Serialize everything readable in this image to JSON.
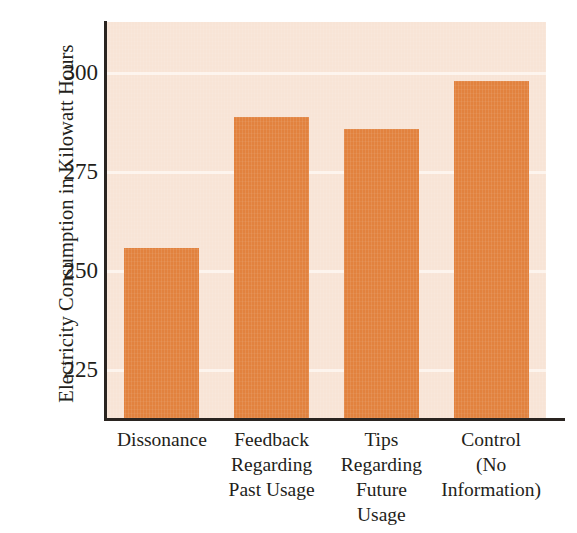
{
  "chart_data": {
    "type": "bar",
    "title": "",
    "xlabel": "",
    "ylabel": "Electricity Consumption in Kilowatt Hours",
    "categories": [
      "Dissonance",
      "Feedback Regarding Past Usage",
      "Tips Regarding Future Usage",
      "Control (No Information)"
    ],
    "category_lines": [
      [
        "Dissonance"
      ],
      [
        "Feedback",
        "Regarding",
        "Past Usage"
      ],
      [
        "Tips",
        "Regarding",
        "Future",
        "Usage"
      ],
      [
        "Control",
        "(No",
        "Information)"
      ]
    ],
    "values": [
      256,
      289,
      286,
      298
    ],
    "ylim": [
      213,
      313
    ],
    "yticks": [
      225,
      250,
      275,
      300
    ],
    "ytick_labels": [
      "225",
      "250",
      "275",
      "300"
    ],
    "grid": true,
    "legend": "none",
    "colors": {
      "bar": "#e2823e",
      "plot_background": "#f8e4d6",
      "gridline": "#fdf4ee",
      "axis": "#2a2420",
      "text": "#231e1a",
      "page_background": "#ffffff"
    }
  }
}
